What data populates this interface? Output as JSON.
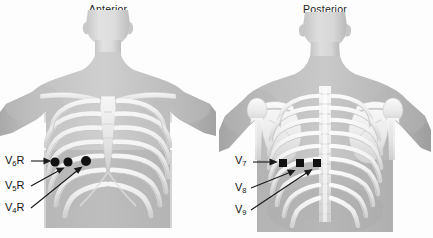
{
  "figure": {
    "kind": "anatomical-illustration",
    "colors": {
      "background": "#fdfdfd",
      "skin": "#b3b3b3",
      "skin_light": "#c9c9c9",
      "skin_shadow": "#9a9a9a",
      "bone": "#efefef",
      "bone_shade": "#d6d6d6",
      "electrode": "#111111",
      "text": "#131313",
      "arrow": "#1a1a1a"
    }
  },
  "panels": [
    {
      "id": "anterior",
      "title": "Anterior",
      "electrode_shape": "circle",
      "electrodes": [
        {
          "id": "V6R",
          "label_main": "V",
          "label_sub": "6",
          "label_suffix": "R",
          "x": 55,
          "y": 162,
          "r": 4.6
        },
        {
          "id": "V5R",
          "label_main": "V",
          "label_sub": "5",
          "label_suffix": "R",
          "x": 68,
          "y": 162,
          "r": 4.6
        },
        {
          "id": "V4R",
          "label_main": "V",
          "label_sub": "4",
          "label_suffix": "R",
          "x": 86,
          "y": 161,
          "r": 5.0
        }
      ],
      "labels": [
        {
          "id": "V6R",
          "text_main": "V",
          "text_sub": "6",
          "text_suffix": "R",
          "x": 5,
          "y": 157
        },
        {
          "id": "V5R",
          "text_main": "V",
          "text_sub": "5",
          "text_suffix": "R",
          "x": 5,
          "y": 182
        },
        {
          "id": "V4R",
          "text_main": "V",
          "text_sub": "4",
          "text_suffix": "R",
          "x": 5,
          "y": 204
        }
      ]
    },
    {
      "id": "posterior",
      "title": "Posterior",
      "electrode_shape": "square",
      "electrodes": [
        {
          "id": "V7",
          "label_main": "V",
          "label_sub": "7",
          "label_suffix": "",
          "x": 66,
          "y": 163,
          "size": 8
        },
        {
          "id": "V8",
          "label_main": "V",
          "label_sub": "8",
          "label_suffix": "",
          "x": 83,
          "y": 163,
          "size": 8
        },
        {
          "id": "V9",
          "label_main": "V",
          "label_sub": "9",
          "label_suffix": "",
          "x": 100,
          "y": 163,
          "size": 8
        }
      ],
      "labels": [
        {
          "id": "V7",
          "text_main": "V",
          "text_sub": "7",
          "text_suffix": "",
          "x": 20,
          "y": 157
        },
        {
          "id": "V8",
          "text_main": "V",
          "text_sub": "8",
          "text_suffix": "",
          "x": 20,
          "y": 184
        },
        {
          "id": "V9",
          "text_main": "V",
          "text_sub": "9",
          "text_suffix": "",
          "x": 20,
          "y": 206
        }
      ]
    }
  ]
}
